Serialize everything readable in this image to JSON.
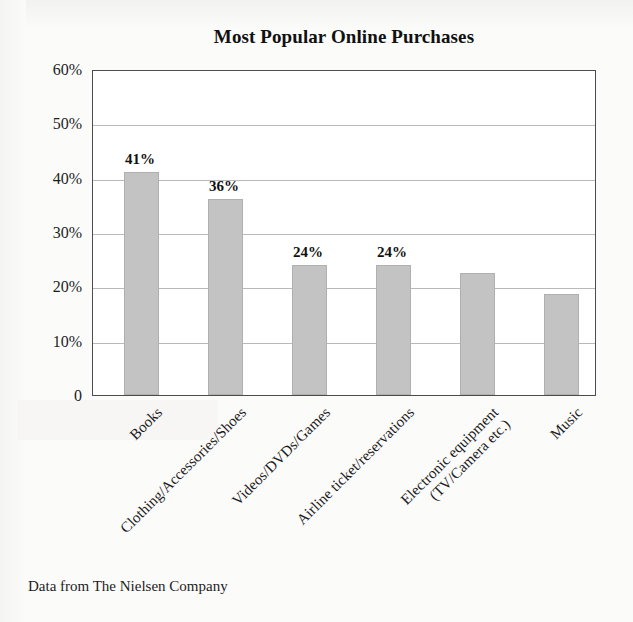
{
  "figure": {
    "background_color": "#fbfbfa",
    "plot_background_color": "#ffffff",
    "bar_color": "#c3c3c3",
    "axis_color": "#4c4c4c",
    "gridline_color": "#b9b9b9"
  },
  "chart_data": {
    "type": "bar",
    "title": "Most Popular Online Purchases",
    "xlabel": "",
    "ylabel": "",
    "ylim": [
      0,
      60
    ],
    "grid": true,
    "legend": null,
    "yticks": [
      0,
      10,
      20,
      30,
      40,
      50,
      60
    ],
    "ytick_labels": [
      "0",
      "10%",
      "20%",
      "30%",
      "40%",
      "50%",
      "60%"
    ],
    "categories": [
      "Books",
      "Clothing/Accessories/Shoes",
      "Videos/DVDs/Games",
      "Airline ticket/reservations",
      "Electronic equipment (TV/Camera etc.)",
      "Music"
    ],
    "category_lines": [
      [
        "Books"
      ],
      [
        "Clothing/Accessories/Shoes"
      ],
      [
        "Videos/DVDs/Games"
      ],
      [
        "Airline ticket/reservations"
      ],
      [
        "Electronic equipment",
        "(TV/Camera etc.)"
      ],
      [
        "Music"
      ]
    ],
    "values": [
      41,
      36,
      24,
      24,
      22.5,
      18.5
    ],
    "data_labels": [
      "41%",
      "36%",
      "24%",
      "24%",
      "",
      ""
    ],
    "source": "Data from The Nielsen Company"
  },
  "caption": {
    "source_text": "Data from The Nielsen Company"
  }
}
